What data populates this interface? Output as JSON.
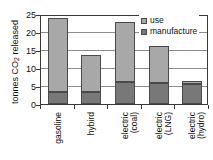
{
  "chart_data": {
    "type": "bar",
    "stacked": true,
    "title": "",
    "xlabel": "",
    "ylabel": "tonnes CO2 released",
    "ylabel_parts": {
      "pre": "tonnes CO",
      "sub": "2",
      "post": " released"
    },
    "ylim": [
      0,
      25
    ],
    "yticks": [
      0,
      5,
      10,
      15,
      20,
      25
    ],
    "ytick_labels": [
      "0",
      "5",
      "10",
      "15",
      "20",
      "25"
    ],
    "grid": true,
    "grid_axis": "y",
    "legend_position": "top-right",
    "categories": [
      "gasoline",
      "hybird",
      "electric (coal)",
      "electric (LNG)",
      "electric (hydro)"
    ],
    "category_lines": [
      [
        "gasoline"
      ],
      [
        "hybird"
      ],
      [
        "electric",
        "(coal)"
      ],
      [
        "electric",
        "(LNG)"
      ],
      [
        "electric",
        "(hydro)"
      ]
    ],
    "series": [
      {
        "name": "use",
        "color": "#a8a8a8",
        "values": [
          20.8,
          10.5,
          16.7,
          10.1,
          0.8
        ]
      },
      {
        "name": "manufacture",
        "color": "#787878",
        "values": [
          3.2,
          3.2,
          6.0,
          5.9,
          5.5
        ]
      }
    ],
    "totals": [
      24.0,
      13.7,
      22.7,
      16.0,
      6.3
    ],
    "stack_order": [
      "manufacture",
      "use"
    ]
  },
  "legend": {
    "items": [
      {
        "label": "use",
        "color": "#a8a8a8"
      },
      {
        "label": "manufacture",
        "color": "#787878"
      }
    ]
  },
  "colors": {
    "use": "#a8a8a8",
    "manufacture": "#787878",
    "axis": "#3a3a3a",
    "grid": "#8c8c8c",
    "background": "#ffffff"
  }
}
